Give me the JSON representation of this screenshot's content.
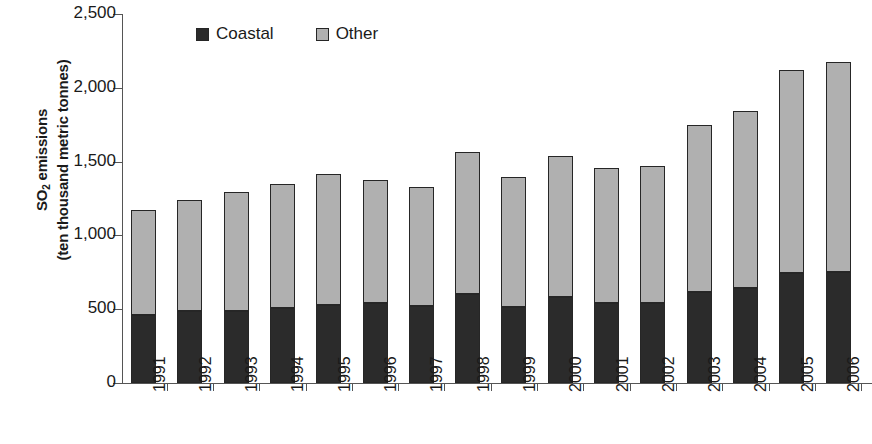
{
  "chart_data": {
    "type": "bar",
    "subtype": "stacked-vertical",
    "title": "",
    "xlabel": "",
    "ylabel": "SO2 emissions (ten thousand metric tonnes)",
    "ylim": [
      0,
      2500
    ],
    "ytick_step": 500,
    "ytick_labels": [
      "2,500",
      "2,000",
      "1,500",
      "1,000",
      "500",
      "0"
    ],
    "ytick_values": [
      2500,
      2000,
      1500,
      1000,
      500,
      0
    ],
    "grid": false,
    "legend_position": "top-center",
    "categories": [
      "1991",
      "1992",
      "1993",
      "1994",
      "1995",
      "1996",
      "1997",
      "1998",
      "1999",
      "2000",
      "2001",
      "2002",
      "2003",
      "2004",
      "2005",
      "2006"
    ],
    "series": [
      {
        "name": "Coastal",
        "color": "#2b2b2b",
        "values": [
          460,
          485,
          490,
          505,
          530,
          540,
          520,
          605,
          515,
          585,
          545,
          545,
          620,
          645,
          745,
          755
        ]
      },
      {
        "name": "Other",
        "color": "#b0b0b0",
        "values": [
          715,
          755,
          805,
          845,
          885,
          835,
          810,
          960,
          880,
          950,
          910,
          925,
          1125,
          1200,
          1375,
          1420
        ]
      }
    ],
    "totals": [
      1175,
      1240,
      1295,
      1350,
      1415,
      1375,
      1330,
      1565,
      1395,
      1535,
      1455,
      1470,
      1745,
      1845,
      2120,
      2175
    ]
  },
  "axis": {
    "y_title_line1_pre": "SO",
    "y_title_line1_sub": "2",
    "y_title_line1_post": " emissions",
    "y_title_line2": "(ten thousand metric tonnes)"
  },
  "legend": {
    "items": [
      {
        "label": "Coastal",
        "swatch": "dark-square-swatch"
      },
      {
        "label": "Other",
        "swatch": "light-square-swatch"
      }
    ]
  }
}
